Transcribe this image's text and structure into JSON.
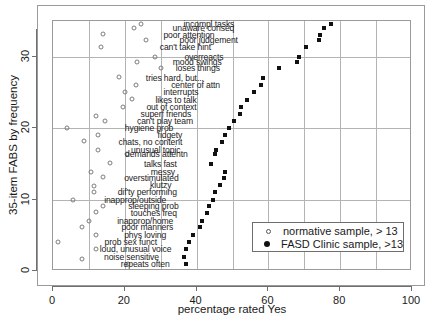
{
  "chart_data": {
    "type": "scatter",
    "title": "",
    "xlabel": "percentage rated Yes",
    "ylabel": "35-item FABS by frequency",
    "xlim": [
      0,
      100
    ],
    "ylim": [
      0,
      35
    ],
    "xticks": [
      0,
      20,
      40,
      60,
      80,
      100
    ],
    "yticks": [
      0,
      10,
      20,
      30
    ],
    "grid": true,
    "grid_spacing": 10,
    "legend_position": "bottom-right",
    "series": [
      {
        "name": "normative sample, > 13",
        "marker": "open-circle",
        "points": [
          {
            "x": 24.5,
            "y": 34.6
          },
          {
            "x": 22.5,
            "y": 34.0
          },
          {
            "x": 14.0,
            "y": 33.2
          },
          {
            "x": 26.0,
            "y": 32.3
          },
          {
            "x": 13.5,
            "y": 31.4
          },
          {
            "x": 28.5,
            "y": 30.0
          },
          {
            "x": 23.5,
            "y": 29.3
          },
          {
            "x": 30.0,
            "y": 28.4
          },
          {
            "x": 18.5,
            "y": 27.1
          },
          {
            "x": 23.0,
            "y": 26.1
          },
          {
            "x": 20.0,
            "y": 25.0
          },
          {
            "x": 22.0,
            "y": 24.1
          },
          {
            "x": 19.5,
            "y": 23.0
          },
          {
            "x": 12.0,
            "y": 21.7
          },
          {
            "x": 14.5,
            "y": 21.0
          },
          {
            "x": 4.0,
            "y": 20.0
          },
          {
            "x": 12.5,
            "y": 19.1
          },
          {
            "x": 8.5,
            "y": 18.2
          },
          {
            "x": 12.5,
            "y": 17.0
          },
          {
            "x": 20.5,
            "y": 16.4
          },
          {
            "x": 16.0,
            "y": 15.1
          },
          {
            "x": 10.5,
            "y": 13.9
          },
          {
            "x": 14.0,
            "y": 13.1
          },
          {
            "x": 11.5,
            "y": 11.9
          },
          {
            "x": 11.5,
            "y": 11.0
          },
          {
            "x": 5.5,
            "y": 10.0
          },
          {
            "x": 14.0,
            "y": 9.1
          },
          {
            "x": 12.0,
            "y": 8.2
          },
          {
            "x": 10.0,
            "y": 7.0
          },
          {
            "x": 8.0,
            "y": 6.2
          },
          {
            "x": 12.0,
            "y": 5.0
          },
          {
            "x": 1.5,
            "y": 4.0
          },
          {
            "x": 12.0,
            "y": 3.1
          },
          {
            "x": 8.0,
            "y": 1.7
          },
          {
            "x": 21.0,
            "y": 1.0
          }
        ]
      },
      {
        "name": "FASD Clinic sample, >13",
        "marker": "filled-square",
        "points": [
          {
            "x": 77.5,
            "y": 34.6
          },
          {
            "x": 75.5,
            "y": 34.0
          },
          {
            "x": 74.5,
            "y": 33.1
          },
          {
            "x": 74.0,
            "y": 32.3
          },
          {
            "x": 70.5,
            "y": 31.4
          },
          {
            "x": 68.5,
            "y": 30.0
          },
          {
            "x": 68.0,
            "y": 29.2
          },
          {
            "x": 63.0,
            "y": 28.4
          },
          {
            "x": 58.5,
            "y": 27.0
          },
          {
            "x": 58.0,
            "y": 26.1
          },
          {
            "x": 56.0,
            "y": 25.0
          },
          {
            "x": 54.0,
            "y": 23.9
          },
          {
            "x": 52.5,
            "y": 23.0
          },
          {
            "x": 52.0,
            "y": 22.0
          },
          {
            "x": 50.5,
            "y": 21.0
          },
          {
            "x": 49.0,
            "y": 20.0
          },
          {
            "x": 48.0,
            "y": 19.0
          },
          {
            "x": 47.0,
            "y": 18.0
          },
          {
            "x": 45.5,
            "y": 17.0
          },
          {
            "x": 45.0,
            "y": 16.4
          },
          {
            "x": 44.0,
            "y": 15.0
          },
          {
            "x": 48.0,
            "y": 13.9
          },
          {
            "x": 47.5,
            "y": 13.0
          },
          {
            "x": 46.5,
            "y": 12.0
          },
          {
            "x": 45.0,
            "y": 11.0
          },
          {
            "x": 44.5,
            "y": 10.0
          },
          {
            "x": 43.5,
            "y": 9.1
          },
          {
            "x": 43.0,
            "y": 8.1
          },
          {
            "x": 41.5,
            "y": 7.0
          },
          {
            "x": 41.0,
            "y": 6.2
          },
          {
            "x": 39.0,
            "y": 5.0
          },
          {
            "x": 38.0,
            "y": 4.0
          },
          {
            "x": 37.0,
            "y": 3.1
          },
          {
            "x": 36.5,
            "y": 2.0
          },
          {
            "x": 37.0,
            "y": 1.0
          }
        ]
      }
    ],
    "annotations": [
      {
        "text": "incompl tasks",
        "x": 50.5,
        "y": 34.6
      },
      {
        "text": "unaware conseq",
        "x": 50.5,
        "y": 34.0
      },
      {
        "text": "poor attention",
        "x": 45.0,
        "y": 33.1
      },
      {
        "text": "poor judgement",
        "x": 51.5,
        "y": 32.3
      },
      {
        "text": "can't take hint",
        "x": 44.0,
        "y": 31.4
      },
      {
        "text": "overreacts",
        "x": 47.5,
        "y": 30.0
      },
      {
        "text": "mood swings",
        "x": 47.0,
        "y": 29.2
      },
      {
        "text": "loses things",
        "x": 46.5,
        "y": 28.4
      },
      {
        "text": "tries hard, but...",
        "x": 42.0,
        "y": 27.0
      },
      {
        "text": "center of attn",
        "x": 46.5,
        "y": 26.1
      },
      {
        "text": "interrupts",
        "x": 40.5,
        "y": 25.0
      },
      {
        "text": "likes to talk",
        "x": 40.0,
        "y": 23.9
      },
      {
        "text": "out of context",
        "x": 40.0,
        "y": 23.0
      },
      {
        "text": "superf friends",
        "x": 38.5,
        "y": 22.0
      },
      {
        "text": "can't play team",
        "x": 39.0,
        "y": 21.0
      },
      {
        "text": "hygiene prob",
        "x": 33.5,
        "y": 20.0
      },
      {
        "text": "fidgety",
        "x": 36.0,
        "y": 19.0
      },
      {
        "text": "chats, no content",
        "x": 36.0,
        "y": 18.0
      },
      {
        "text": "unusual topic",
        "x": 35.5,
        "y": 17.0
      },
      {
        "text": "demands attentn",
        "x": 37.5,
        "y": 16.4
      },
      {
        "text": "talks fast",
        "x": 34.5,
        "y": 15.0
      },
      {
        "text": "messy",
        "x": 34.0,
        "y": 13.9
      },
      {
        "text": "overstimulated",
        "x": 35.0,
        "y": 13.0
      },
      {
        "text": "klutzy",
        "x": 33.0,
        "y": 12.0
      },
      {
        "text": "dif'ty performing",
        "x": 34.5,
        "y": 11.0
      },
      {
        "text": "inapprop/outside",
        "x": 31.5,
        "y": 10.0
      },
      {
        "text": "sleeping prob",
        "x": 35.0,
        "y": 9.1
      },
      {
        "text": "touches freq",
        "x": 34.5,
        "y": 8.1
      },
      {
        "text": "inapprop/home",
        "x": 33.5,
        "y": 7.0
      },
      {
        "text": "poor manners",
        "x": 33.5,
        "y": 6.2
      },
      {
        "text": "phys loving",
        "x": 31.5,
        "y": 5.0
      },
      {
        "text": "prob sex funct",
        "x": 29.0,
        "y": 4.0
      },
      {
        "text": "loud, unusual voice",
        "x": 33.0,
        "y": 3.1
      },
      {
        "text": "noise sensitive",
        "x": 29.5,
        "y": 2.0
      },
      {
        "text": "repeats often",
        "x": 32.5,
        "y": 1.0
      }
    ]
  },
  "colors": {
    "normative_marker": "#7d7d7d",
    "clinic_marker": "#111111",
    "grid": "#b4b4b4",
    "frame": "#9a9a9a",
    "text": "#1a1a1a",
    "background": "#ffffff"
  }
}
